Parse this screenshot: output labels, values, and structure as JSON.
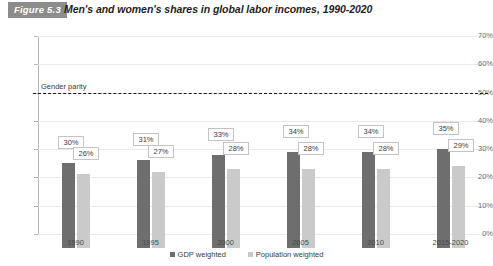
{
  "figure": {
    "badge": "Figure 5.3",
    "title": "Men's and women's shares in global labor incomes, 1990-2020"
  },
  "chart_data": {
    "type": "bar",
    "title": "Men's and women's shares in global labor incomes, 1990-2020",
    "xlabel": "",
    "ylabel": "",
    "ylim": [
      0,
      70
    ],
    "ytick_labels": [
      "0%",
      "10%",
      "20%",
      "30%",
      "40%",
      "50%",
      "60%",
      "70%"
    ],
    "ytick_values": [
      0,
      10,
      20,
      30,
      40,
      50,
      60,
      70
    ],
    "grid": true,
    "legend_position": "bottom",
    "categories": [
      "1990",
      "1995",
      "2000",
      "2005",
      "2010",
      "2015-2020"
    ],
    "series": [
      {
        "name": "GDP weighted",
        "color": "#6e6e6e",
        "values": [
          30,
          31,
          33,
          34,
          34,
          35
        ],
        "labels": [
          "30%",
          "31%",
          "33%",
          "34%",
          "34%",
          "35%"
        ]
      },
      {
        "name": "Population weighted",
        "color": "#cacaca",
        "values": [
          26,
          27,
          28,
          28,
          28,
          29
        ],
        "labels": [
          "26%",
          "27%",
          "28%",
          "28%",
          "28%",
          "29%"
        ]
      }
    ],
    "annotations": [
      {
        "name": "gender-parity",
        "label": "Gender parity",
        "value": 50,
        "style": "dashed",
        "color": "#1a1a1a"
      }
    ]
  }
}
